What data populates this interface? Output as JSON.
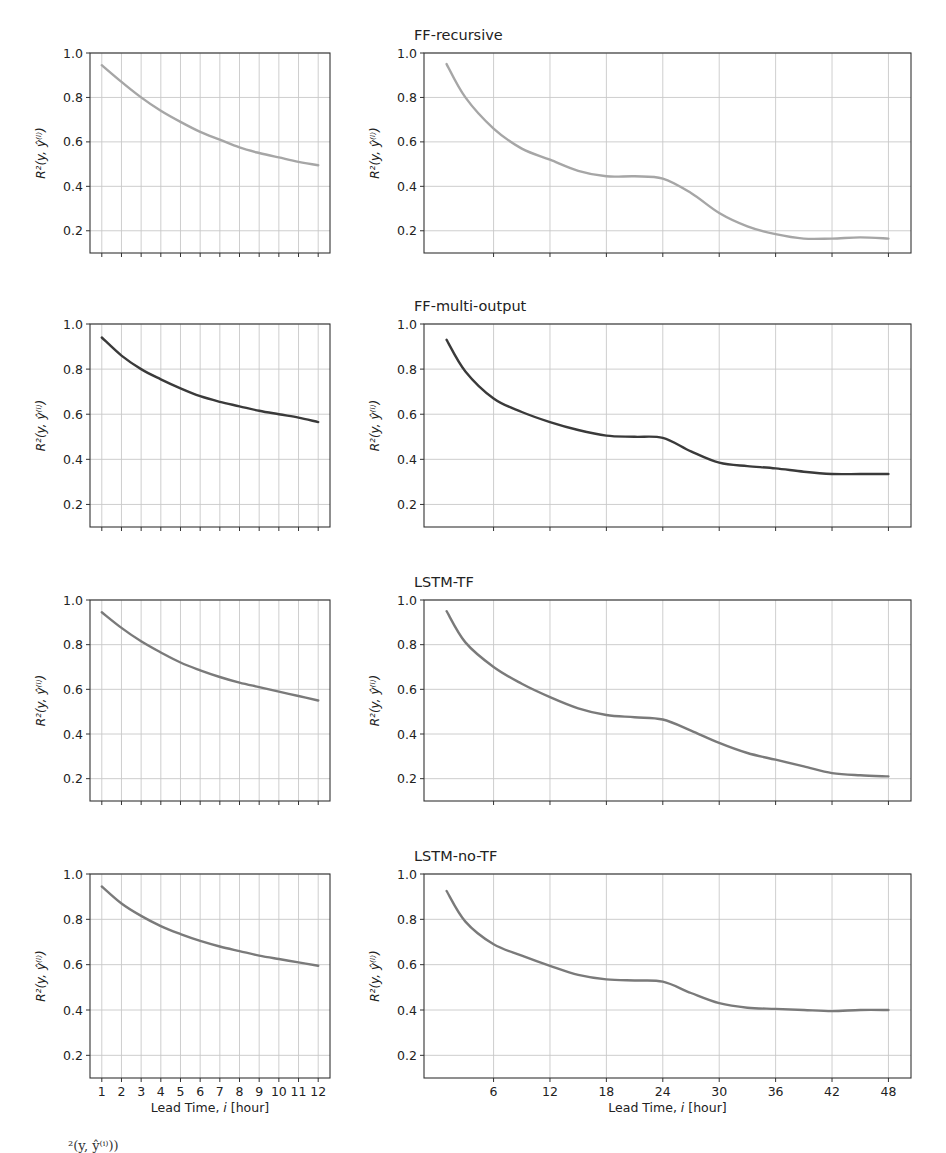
{
  "figure": {
    "ylabel": "R²(y, ŷ⁽ⁱ⁾)",
    "xlabel": "Lead Time, i [hour]",
    "caption_fragment": "²(y, ŷ⁽ⁱ⁾))"
  },
  "chart_data": [
    {
      "type": "line",
      "panel": "row1-left",
      "title": "",
      "model": "FF-recursive",
      "x": [
        1,
        2,
        3,
        4,
        5,
        6,
        7,
        8,
        9,
        10,
        11,
        12
      ],
      "values": [
        0.945,
        0.87,
        0.8,
        0.74,
        0.69,
        0.645,
        0.61,
        0.575,
        0.55,
        0.53,
        0.51,
        0.495
      ],
      "xlabel": "",
      "ylabel": "R²(y, ŷ⁽ⁱ⁾)",
      "ylim": [
        0.1,
        1.0
      ],
      "xlim": [
        0.4,
        12.6
      ],
      "yticks": [
        0.2,
        0.4,
        0.6,
        0.8,
        1.0
      ],
      "xticks": [
        1,
        2,
        3,
        4,
        5,
        6,
        7,
        8,
        9,
        10,
        11,
        12
      ],
      "xtick_labels_visible": false,
      "grid": true,
      "color": "#a6a6a6"
    },
    {
      "type": "line",
      "panel": "row1-right",
      "title": "FF-recursive",
      "x": [
        1,
        3,
        6,
        9,
        12,
        15,
        18,
        21,
        24,
        27,
        30,
        33,
        36,
        39,
        42,
        45,
        48
      ],
      "values": [
        0.95,
        0.8,
        0.66,
        0.57,
        0.52,
        0.47,
        0.445,
        0.445,
        0.435,
        0.37,
        0.28,
        0.22,
        0.185,
        0.165,
        0.165,
        0.17,
        0.165
      ],
      "xlabel": "",
      "ylabel": "R²(y, ŷ⁽ⁱ⁾)",
      "ylim": [
        0.1,
        1.0
      ],
      "xlim": [
        -1.4,
        50.4
      ],
      "yticks": [
        0.2,
        0.4,
        0.6,
        0.8,
        1.0
      ],
      "xticks": [
        6,
        12,
        18,
        24,
        30,
        36,
        42,
        48
      ],
      "xtick_labels_visible": false,
      "grid": true,
      "color": "#a6a6a6"
    },
    {
      "type": "line",
      "panel": "row2-left",
      "title": "",
      "model": "FF-multi-output",
      "x": [
        1,
        2,
        3,
        4,
        5,
        6,
        7,
        8,
        9,
        10,
        11,
        12
      ],
      "values": [
        0.94,
        0.86,
        0.8,
        0.755,
        0.715,
        0.68,
        0.655,
        0.635,
        0.615,
        0.6,
        0.585,
        0.565
      ],
      "xlabel": "",
      "ylabel": "R²(y, ŷ⁽ⁱ⁾)",
      "ylim": [
        0.1,
        1.0
      ],
      "xlim": [
        0.4,
        12.6
      ],
      "yticks": [
        0.2,
        0.4,
        0.6,
        0.8,
        1.0
      ],
      "xticks": [
        1,
        2,
        3,
        4,
        5,
        6,
        7,
        8,
        9,
        10,
        11,
        12
      ],
      "xtick_labels_visible": false,
      "grid": true,
      "color": "#3a3a3a"
    },
    {
      "type": "line",
      "panel": "row2-right",
      "title": "FF-multi-output",
      "x": [
        1,
        3,
        6,
        9,
        12,
        15,
        18,
        21,
        24,
        27,
        30,
        33,
        36,
        39,
        42,
        45,
        48
      ],
      "values": [
        0.93,
        0.79,
        0.67,
        0.61,
        0.565,
        0.53,
        0.505,
        0.5,
        0.495,
        0.435,
        0.385,
        0.37,
        0.36,
        0.345,
        0.335,
        0.335,
        0.335
      ],
      "xlabel": "",
      "ylabel": "R²(y, ŷ⁽ⁱ⁾)",
      "ylim": [
        0.1,
        1.0
      ],
      "xlim": [
        -1.4,
        50.4
      ],
      "yticks": [
        0.2,
        0.4,
        0.6,
        0.8,
        1.0
      ],
      "xticks": [
        6,
        12,
        18,
        24,
        30,
        36,
        42,
        48
      ],
      "xtick_labels_visible": false,
      "grid": true,
      "color": "#3a3a3a"
    },
    {
      "type": "line",
      "panel": "row3-left",
      "title": "",
      "model": "LSTM-TF",
      "x": [
        1,
        2,
        3,
        4,
        5,
        6,
        7,
        8,
        9,
        10,
        11,
        12
      ],
      "values": [
        0.945,
        0.875,
        0.815,
        0.765,
        0.72,
        0.685,
        0.655,
        0.63,
        0.61,
        0.59,
        0.57,
        0.55
      ],
      "xlabel": "",
      "ylabel": "R²(y, ŷ⁽ⁱ⁾)",
      "ylim": [
        0.1,
        1.0
      ],
      "xlim": [
        0.4,
        12.6
      ],
      "yticks": [
        0.2,
        0.4,
        0.6,
        0.8,
        1.0
      ],
      "xticks": [
        1,
        2,
        3,
        4,
        5,
        6,
        7,
        8,
        9,
        10,
        11,
        12
      ],
      "xtick_labels_visible": false,
      "grid": true,
      "color": "#7a7a7a"
    },
    {
      "type": "line",
      "panel": "row3-right",
      "title": "LSTM-TF",
      "x": [
        1,
        3,
        6,
        9,
        12,
        15,
        18,
        21,
        24,
        27,
        30,
        33,
        36,
        39,
        42,
        45,
        48
      ],
      "values": [
        0.95,
        0.81,
        0.7,
        0.625,
        0.565,
        0.515,
        0.485,
        0.475,
        0.465,
        0.415,
        0.36,
        0.315,
        0.285,
        0.255,
        0.225,
        0.215,
        0.21
      ],
      "xlabel": "",
      "ylabel": "R²(y, ŷ⁽ⁱ⁾)",
      "ylim": [
        0.1,
        1.0
      ],
      "xlim": [
        -1.4,
        50.4
      ],
      "yticks": [
        0.2,
        0.4,
        0.6,
        0.8,
        1.0
      ],
      "xticks": [
        6,
        12,
        18,
        24,
        30,
        36,
        42,
        48
      ],
      "xtick_labels_visible": false,
      "grid": true,
      "color": "#7a7a7a"
    },
    {
      "type": "line",
      "panel": "row4-left",
      "title": "",
      "model": "LSTM-no-TF",
      "x": [
        1,
        2,
        3,
        4,
        5,
        6,
        7,
        8,
        9,
        10,
        11,
        12
      ],
      "values": [
        0.945,
        0.87,
        0.815,
        0.77,
        0.735,
        0.705,
        0.68,
        0.66,
        0.64,
        0.625,
        0.61,
        0.595
      ],
      "xlabel": "Lead Time, i [hour]",
      "ylabel": "R²(y, ŷ⁽ⁱ⁾)",
      "ylim": [
        0.1,
        1.0
      ],
      "xlim": [
        0.4,
        12.6
      ],
      "yticks": [
        0.2,
        0.4,
        0.6,
        0.8,
        1.0
      ],
      "xticks": [
        1,
        2,
        3,
        4,
        5,
        6,
        7,
        8,
        9,
        10,
        11,
        12
      ],
      "xtick_labels_visible": true,
      "grid": true,
      "color": "#7a7a7a"
    },
    {
      "type": "line",
      "panel": "row4-right",
      "title": "LSTM-no-TF",
      "x": [
        1,
        3,
        6,
        9,
        12,
        15,
        18,
        21,
        24,
        27,
        30,
        33,
        36,
        39,
        42,
        45,
        48
      ],
      "values": [
        0.925,
        0.79,
        0.69,
        0.64,
        0.595,
        0.555,
        0.535,
        0.53,
        0.525,
        0.475,
        0.43,
        0.41,
        0.405,
        0.4,
        0.395,
        0.4,
        0.4
      ],
      "xlabel": "Lead Time, i [hour]",
      "ylabel": "R²(y, ŷ⁽ⁱ⁾)",
      "ylim": [
        0.1,
        1.0
      ],
      "xlim": [
        -1.4,
        50.4
      ],
      "yticks": [
        0.2,
        0.4,
        0.6,
        0.8,
        1.0
      ],
      "xticks": [
        6,
        12,
        18,
        24,
        30,
        36,
        42,
        48
      ],
      "xtick_labels_visible": true,
      "grid": true,
      "color": "#7a7a7a"
    }
  ],
  "layout": {
    "left_axes": {
      "x0": 90,
      "x1": 330
    },
    "right_axes": {
      "x0": 424,
      "x1": 911
    },
    "rows": [
      {
        "y0": 53,
        "y1": 253
      },
      {
        "y0": 324,
        "y1": 527
      },
      {
        "y0": 600,
        "y1": 801
      },
      {
        "y0": 874,
        "y1": 1078
      }
    ]
  }
}
